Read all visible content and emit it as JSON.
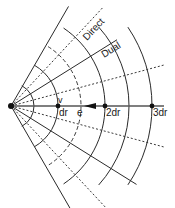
{
  "diagram": {
    "origin": {
      "x": 11,
      "y": 106
    },
    "unit_px": 47,
    "colors": {
      "line": "#2a2a2a",
      "dashed": "#3a3a3a",
      "axis": "#555555",
      "background": "#ffffff"
    },
    "labels": {
      "direct": "Direct",
      "dual": "Dual",
      "v": "v",
      "e": "e",
      "dr1": "dr",
      "dr2": "2dr",
      "dr3": "3dr"
    },
    "arcs": [
      {
        "r": 23,
        "style": "solid",
        "a0": -62,
        "a1": 62
      },
      {
        "r": 47,
        "style": "solid",
        "a0": -60,
        "a1": 60
      },
      {
        "r": 70,
        "style": "dashed",
        "a0": -58,
        "a1": 58
      },
      {
        "r": 94,
        "style": "solid",
        "a0": -56,
        "a1": 56
      },
      {
        "r": 118,
        "style": "solid",
        "a0": -42,
        "a1": 42
      },
      {
        "r": 141,
        "style": "solid",
        "a0": -34,
        "a1": 34
      }
    ],
    "rays": [
      {
        "angle": -60,
        "len": 115,
        "style": "solid"
      },
      {
        "angle": -47,
        "len": 135,
        "style": "dashed",
        "label": "direct"
      },
      {
        "angle": -32,
        "len": 125,
        "style": "solid",
        "label": "dual"
      },
      {
        "angle": -15,
        "len": 160,
        "style": "dashed"
      },
      {
        "angle": 15,
        "len": 160,
        "style": "dashed"
      },
      {
        "angle": 32,
        "len": 148,
        "style": "solid"
      },
      {
        "angle": 47,
        "len": 150,
        "style": "dashed"
      },
      {
        "angle": 60,
        "len": 170,
        "style": "solid"
      }
    ],
    "axis_points": [
      {
        "k": 0
      },
      {
        "k": 1,
        "label": "dr1"
      },
      {
        "k": 2,
        "label": "dr2"
      },
      {
        "k": 3,
        "label": "dr3"
      }
    ],
    "arrow": {
      "tip_x": 84,
      "tail_x": 96
    }
  }
}
